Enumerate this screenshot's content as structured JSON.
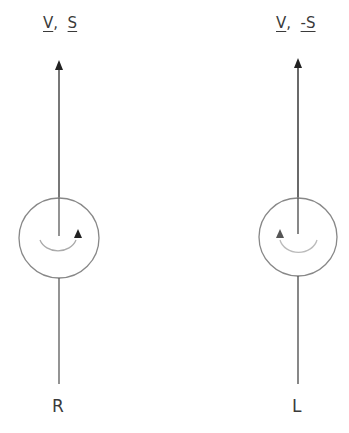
{
  "diagrams": [
    {
      "id": "right-handed",
      "top_label": {
        "v": "V",
        "sep": ",",
        "s": "S"
      },
      "bottom_label": "R",
      "rotation": "clockwise"
    },
    {
      "id": "left-handed",
      "top_label": {
        "v": "V",
        "sep": ",",
        "s": "-S"
      },
      "bottom_label": "L",
      "rotation": "counterclockwise"
    }
  ]
}
